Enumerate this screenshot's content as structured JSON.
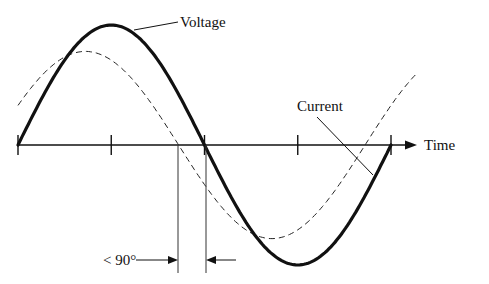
{
  "labels": {
    "voltage": "Voltage",
    "current": "Current",
    "time": "Time",
    "phase": "< 90°"
  },
  "chart_data": {
    "type": "line",
    "title": "",
    "xlabel": "Time",
    "ylabel": "",
    "x_unit": "degrees",
    "xlim": [
      0,
      360
    ],
    "ylim": [
      -1,
      1
    ],
    "ticks_deg": [
      0,
      90,
      180,
      270,
      360
    ],
    "series": [
      {
        "name": "Voltage",
        "style": "solid-thick",
        "amplitude": 1.0,
        "phase_deg": 0
      },
      {
        "name": "Current",
        "style": "dashed",
        "amplitude": 0.78,
        "phase_deg": 25
      }
    ],
    "annotation": {
      "text": "< 90°",
      "meaning": "current leads voltage by less than 90 degrees"
    }
  }
}
